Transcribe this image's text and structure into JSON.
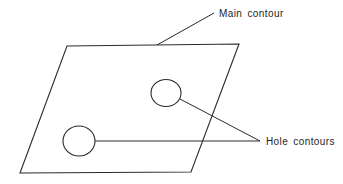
{
  "diagram": {
    "labels": {
      "main_contour": "Main contour",
      "hole_contours": "Hole contours"
    },
    "shapes": {
      "main_contour": {
        "type": "parallelogram",
        "points": [
          [
            67,
            46
          ],
          [
            239,
            44
          ],
          [
            191,
            172
          ],
          [
            20,
            173
          ]
        ]
      },
      "holes": [
        {
          "name": "hole-contour-right",
          "cx": 166,
          "cy": 93,
          "rx": 15,
          "ry": 13.5
        },
        {
          "name": "hole-contour-left",
          "cx": 79,
          "cy": 141,
          "rx": 16,
          "ry": 15
        }
      ]
    },
    "leaders": {
      "main_contour": [
        [
          157,
          45
        ],
        [
          214,
          13
        ]
      ],
      "hole_right": [
        [
          180,
          99
        ],
        [
          260,
          141
        ]
      ],
      "hole_left": [
        [
          95,
          141
        ],
        [
          260,
          141
        ]
      ]
    },
    "colors": {
      "stroke": "#2a2a2a",
      "text": "#1e1e1e",
      "background": "#ffffff"
    }
  }
}
